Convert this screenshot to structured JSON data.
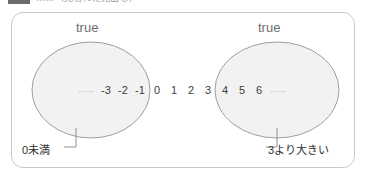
{
  "top_cutoff": {
    "icon": "dark-block-icon",
    "text": "……（見切れた見出し）"
  },
  "panel": {
    "border_color": "#c9c9c9",
    "background": "#ffffff"
  },
  "sets": [
    {
      "id": "left",
      "true_label": "true",
      "callout": "0未満",
      "fill": "#f2f2f2",
      "stroke": "#9e9e9e",
      "members": [
        "……",
        "-3",
        "-2",
        "-1"
      ]
    },
    {
      "id": "right",
      "true_label": "true",
      "callout": "3より大きい",
      "fill": "#f2f2f2",
      "stroke": "#9e9e9e",
      "members": [
        "4",
        "5",
        "6",
        "……"
      ]
    }
  ],
  "number_line": {
    "leading_dots": "……",
    "trailing_dots": "……",
    "numbers": [
      "-3",
      "-2",
      "-1",
      "0",
      "1",
      "2",
      "3",
      "4",
      "5",
      "6"
    ]
  },
  "colors": {
    "ellipse_fill": "#f2f2f2",
    "ellipse_stroke": "#9e9e9e",
    "panel_stroke": "#c9c9c9",
    "leader_line": "#8f8f8f",
    "true_text": "#6d6d6d",
    "number_text": "#3d3d3d",
    "callout_text": "#2f2f2f"
  }
}
